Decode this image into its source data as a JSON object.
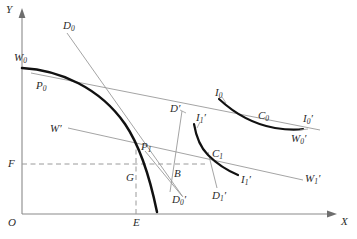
{
  "figure": {
    "type": "economics-diagram",
    "title": "",
    "background_color": "#ffffff",
    "axes": {
      "y_label": "Y",
      "x_label": "X",
      "origin_label": "O",
      "axis_color": "#8a8a8a"
    },
    "colors": {
      "heavy_curve": "#111111",
      "light_line": "#8a8a8a",
      "dashed_line": "#9a9a9a",
      "label_text": "#2b2b2b"
    },
    "labels": [
      {
        "id": "y-axis",
        "text": "Y",
        "sub": "",
        "prime": "",
        "x": 8,
        "y": 6
      },
      {
        "id": "x-axis",
        "text": "X",
        "sub": "",
        "prime": "",
        "x": 341,
        "y": 220
      },
      {
        "id": "origin",
        "text": "O",
        "sub": "",
        "prime": "",
        "x": 8,
        "y": 218
      },
      {
        "id": "w0",
        "text": "W",
        "sub": "0",
        "prime": "",
        "x": 14,
        "y": 53
      },
      {
        "id": "p0",
        "text": "P",
        "sub": "0",
        "prime": "",
        "x": 35,
        "y": 81
      },
      {
        "id": "d0",
        "text": "D",
        "sub": "0",
        "prime": "",
        "x": 62,
        "y": 21
      },
      {
        "id": "w-prime",
        "text": "W",
        "sub": "",
        "prime": "'",
        "x": 51,
        "y": 124
      },
      {
        "id": "f",
        "text": "F",
        "sub": "",
        "prime": "",
        "x": 8,
        "y": 160
      },
      {
        "id": "g",
        "text": "G",
        "sub": "",
        "prime": "",
        "x": 126,
        "y": 173
      },
      {
        "id": "e",
        "text": "E",
        "sub": "",
        "prime": "",
        "x": 138,
        "y": 218
      },
      {
        "id": "p1",
        "text": "P",
        "sub": "1",
        "prime": "",
        "x": 141,
        "y": 142
      },
      {
        "id": "b",
        "text": "B",
        "sub": "",
        "prime": "",
        "x": 174,
        "y": 170
      },
      {
        "id": "d-prime",
        "text": "D",
        "sub": "",
        "prime": "'",
        "x": 172,
        "y": 104
      },
      {
        "id": "i1-prime",
        "text": "I",
        "sub": "1",
        "prime": "'",
        "x": 196,
        "y": 115
      },
      {
        "id": "i0",
        "text": "I",
        "sub": "0",
        "prime": "",
        "x": 216,
        "y": 90
      },
      {
        "id": "c0",
        "text": "C",
        "sub": "0",
        "prime": "",
        "x": 258,
        "y": 112
      },
      {
        "id": "i0-prime",
        "text": "I",
        "sub": "0",
        "prime": "'",
        "x": 297,
        "y": 117
      },
      {
        "id": "w0-prime",
        "text": "W",
        "sub": "0",
        "prime": "'",
        "x": 291,
        "y": 135
      },
      {
        "id": "c1",
        "text": "C",
        "sub": "1",
        "prime": "",
        "x": 213,
        "y": 150
      },
      {
        "id": "i1b-prime",
        "text": "I",
        "sub": "1",
        "prime": "'",
        "x": 233,
        "y": 177
      },
      {
        "id": "d1-prime",
        "text": "D",
        "sub": "1",
        "prime": "'",
        "x": 212,
        "y": 192
      },
      {
        "id": "d0b-prime",
        "text": "D",
        "sub": "0",
        "prime": "'",
        "x": 172,
        "y": 196
      },
      {
        "id": "w1-prime",
        "text": "W",
        "sub": "1",
        "prime": "'",
        "x": 305,
        "y": 175
      }
    ],
    "curves": [
      {
        "id": "transformation-curve",
        "name": "production-possibility-frontier",
        "style": "heavy",
        "endpoints": "W0 to below E"
      },
      {
        "id": "trade-indifference-c0",
        "name": "trade-indifference-curve-0",
        "style": "heavy",
        "endpoints": "I0 to I0-prime"
      },
      {
        "id": "trade-indifference-c1",
        "name": "trade-indifference-curve-1",
        "style": "heavy",
        "endpoints": "I1-prime to I1b-prime"
      },
      {
        "id": "price-line-d0",
        "name": "price-line-D0",
        "style": "light"
      },
      {
        "id": "price-line-w0",
        "name": "terms-of-trade-line-W0",
        "style": "light"
      },
      {
        "id": "price-line-w1",
        "name": "terms-of-trade-line-W1",
        "style": "light"
      },
      {
        "id": "price-line-d0-prime",
        "name": "price-line-D0-prime",
        "style": "light"
      },
      {
        "id": "price-line-d1-prime",
        "name": "price-line-D1-prime",
        "style": "light"
      },
      {
        "id": "guide-f-g",
        "name": "dashed-guide-horizontal-F",
        "style": "dashed"
      },
      {
        "id": "guide-e-g",
        "name": "dashed-guide-vertical-E",
        "style": "dashed"
      }
    ]
  }
}
